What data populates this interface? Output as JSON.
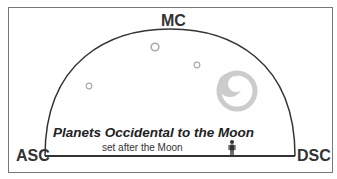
{
  "diagram": {
    "labels": {
      "mc": "MC",
      "asc": "ASC",
      "dsc": "DSC"
    },
    "title": "Planets Occidental to the Moon",
    "subtitle": "set after the Moon",
    "elements": [
      "horizon-dome",
      "planet-1",
      "planet-2",
      "planet-3",
      "moon",
      "observer"
    ],
    "colors": {
      "line": "#333333",
      "planet": "#aaaaaa",
      "moon": "#cccccc"
    }
  }
}
